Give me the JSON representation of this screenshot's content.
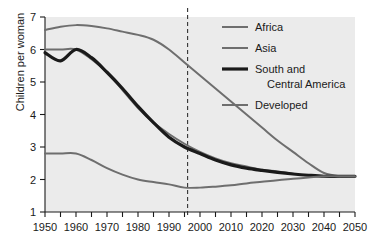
{
  "chart_data": {
    "type": "line",
    "title": "",
    "xlabel": "",
    "ylabel": "Children per woman",
    "xlim": [
      1950,
      2050
    ],
    "ylim": [
      1,
      7
    ],
    "xticks": [
      1950,
      1960,
      1970,
      1980,
      1990,
      2000,
      2010,
      2020,
      2030,
      2040,
      2050
    ],
    "yticks": [
      1,
      2,
      3,
      4,
      5,
      6,
      7
    ],
    "xtick_labels": [
      "1950",
      "1960",
      "1970",
      "1980",
      "1990",
      "2000",
      "2010",
      "2020",
      "2030",
      "2040",
      "2050"
    ],
    "ytick_labels": [
      "1",
      "2",
      "3",
      "4",
      "5",
      "6",
      "7"
    ],
    "minor_tick_interval": 5,
    "grid": false,
    "legend_position": "top-right",
    "plot_background": "#ebebeb",
    "annotations": [
      {
        "name": "projection-divider",
        "type": "vertical-dashed-line",
        "x": 1996,
        "color": "#333333"
      }
    ],
    "series": [
      {
        "name": "Africa",
        "color": "#6e6e6e",
        "width": 2.0,
        "x": [
          1950,
          1955,
          1960,
          1965,
          1970,
          1975,
          1980,
          1985,
          1990,
          1995,
          2000,
          2005,
          2010,
          2015,
          2020,
          2025,
          2030,
          2035,
          2040,
          2045,
          2050
        ],
        "values": [
          6.6,
          6.7,
          6.75,
          6.72,
          6.65,
          6.55,
          6.45,
          6.3,
          6.0,
          5.6,
          5.2,
          4.8,
          4.4,
          4.0,
          3.6,
          3.2,
          2.85,
          2.5,
          2.2,
          2.1,
          2.1
        ]
      },
      {
        "name": "Asia",
        "color": "#6e6e6e",
        "width": 2.0,
        "x": [
          1950,
          1955,
          1960,
          1965,
          1970,
          1975,
          1980,
          1985,
          1990,
          1995,
          2000,
          2005,
          2010,
          2015,
          2020,
          2025,
          2030,
          2035,
          2040,
          2045,
          2050
        ],
        "values": [
          6.0,
          6.0,
          6.0,
          5.7,
          5.3,
          4.75,
          4.2,
          3.75,
          3.4,
          3.1,
          2.85,
          2.65,
          2.5,
          2.4,
          2.3,
          2.25,
          2.18,
          2.12,
          2.1,
          2.1,
          2.1
        ]
      },
      {
        "name": "South and Central America",
        "color": "#1a1a1a",
        "width": 3.2,
        "x": [
          1950,
          1955,
          1960,
          1965,
          1970,
          1975,
          1980,
          1985,
          1990,
          1995,
          2000,
          2005,
          2010,
          2015,
          2020,
          2025,
          2030,
          2035,
          2040,
          2045,
          2050
        ],
        "values": [
          5.9,
          5.65,
          6.0,
          5.75,
          5.3,
          4.8,
          4.25,
          3.75,
          3.3,
          3.0,
          2.8,
          2.6,
          2.45,
          2.35,
          2.28,
          2.22,
          2.17,
          2.13,
          2.1,
          2.1,
          2.1
        ]
      },
      {
        "name": "Developed",
        "color": "#6e6e6e",
        "width": 2.0,
        "x": [
          1950,
          1955,
          1960,
          1965,
          1970,
          1975,
          1980,
          1985,
          1990,
          1995,
          2000,
          2005,
          2010,
          2015,
          2020,
          2025,
          2030,
          2035,
          2040,
          2045,
          2050
        ],
        "values": [
          2.8,
          2.8,
          2.8,
          2.6,
          2.35,
          2.15,
          2.0,
          1.92,
          1.85,
          1.75,
          1.75,
          1.78,
          1.82,
          1.88,
          1.93,
          1.98,
          2.02,
          2.06,
          2.1,
          2.1,
          2.1
        ]
      }
    ]
  },
  "legend": {
    "entries": [
      {
        "label": "Africa",
        "label2": ""
      },
      {
        "label": "Asia",
        "label2": ""
      },
      {
        "label": "South and",
        "label2": "Central America"
      },
      {
        "label": "Developed",
        "label2": ""
      }
    ]
  }
}
